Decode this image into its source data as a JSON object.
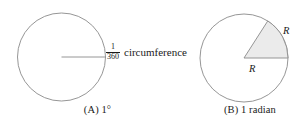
{
  "panels": {
    "degree": {
      "caption_tag": "(A)",
      "caption_text": "1°",
      "annotation": {
        "fraction_numerator": "1",
        "fraction_denominator": "360",
        "label": "circumference"
      },
      "circle": {
        "center_x": 61.5,
        "center_y": 57,
        "radius": 44,
        "stroke_color": "#8a8a8a",
        "fill_color": "#ffffff"
      },
      "radius_line": {
        "from_x": 61.5,
        "from_y": 57,
        "to_x": 105.5,
        "to_y": 57,
        "stroke_color": "#8a8a8a"
      }
    },
    "radian": {
      "caption_tag": "(B)",
      "caption_text": "1 radian",
      "circle": {
        "center_x": 49,
        "center_y": 58,
        "radius": 44,
        "stroke_color": "#8a8a8a",
        "fill_color": "#ffffff"
      },
      "sector": {
        "angle_degrees": 57.3,
        "angle_radians": 1,
        "fill_color": "#ebebeb",
        "stroke_color": "#8a8a8a"
      },
      "arc_label": "R",
      "radius_label": "R"
    }
  },
  "colors": {
    "stroke": "#8a8a8a",
    "sector_fill": "#ebebeb",
    "text": "#1a1a1a",
    "background": "#ffffff"
  }
}
